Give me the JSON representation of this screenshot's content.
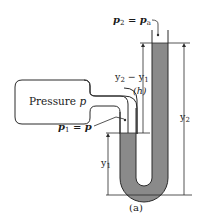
{
  "diagram": {
    "caption": "(a)",
    "labels": {
      "p2_eq_pa": {
        "base": "p",
        "sub": "2",
        "rest": " = p",
        "sub2": "a"
      },
      "pressure": {
        "text": "Pressure ",
        "var": "p"
      },
      "p1_eq_p": {
        "base": "p",
        "sub": "1",
        "rest": " = p"
      },
      "y2_minus_y1": {
        "a": "y",
        "asub": "2",
        "mid": " − y",
        "bsub": "1"
      },
      "h": "(h)",
      "y1": {
        "base": "y",
        "sub": "1"
      },
      "y2": {
        "base": "y",
        "sub": "2"
      }
    },
    "colors": {
      "fluid": "#8a8a8a",
      "line": "#2a2a2a",
      "background": "#ffffff"
    }
  }
}
